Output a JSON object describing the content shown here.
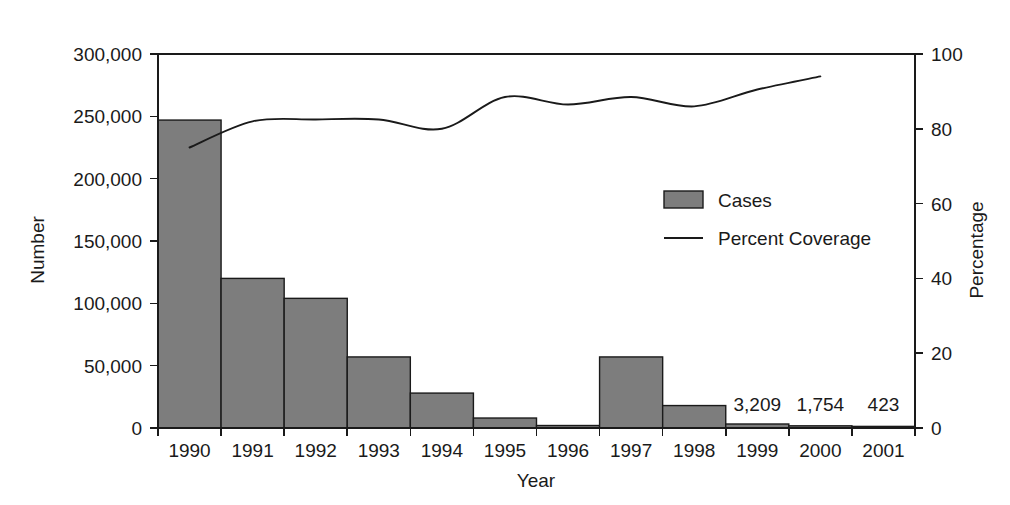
{
  "chart_data": {
    "type": "bar",
    "title": "",
    "xlabel": "Year",
    "ylabel": "Number",
    "y2label": "Percentage",
    "categories": [
      "1990",
      "1991",
      "1992",
      "1993",
      "1994",
      "1995",
      "1996",
      "1997",
      "1998",
      "1999",
      "2000",
      "2001"
    ],
    "ylim": [
      0,
      300000
    ],
    "y2lim": [
      0,
      100
    ],
    "grid": false,
    "legend_position": "center-right",
    "y_ticks": [
      "0",
      "50,000",
      "100,000",
      "150,000",
      "200,000",
      "250,000",
      "300,000"
    ],
    "y_tick_values": [
      0,
      50000,
      100000,
      150000,
      200000,
      250000,
      300000
    ],
    "y2_ticks": [
      "0",
      "20",
      "40",
      "60",
      "80",
      "100"
    ],
    "y2_tick_values": [
      0,
      20,
      40,
      60,
      80,
      100
    ],
    "series": [
      {
        "name": "Cases",
        "kind": "bar",
        "axis": "left",
        "values": [
          247000,
          120000,
          104000,
          57000,
          28000,
          8000,
          2000,
          57000,
          18000,
          3209,
          1754,
          423
        ]
      },
      {
        "name": "Percent Coverage",
        "kind": "line",
        "axis": "right",
        "x": [
          "1990",
          "1991",
          "1992",
          "1993",
          "1994",
          "1995",
          "1996",
          "1997",
          "1998",
          "1999",
          "2000"
        ],
        "values": [
          75,
          82,
          82.5,
          82.5,
          80,
          88.5,
          86.5,
          88.5,
          86,
          90.5,
          94
        ]
      }
    ],
    "annotations": [
      {
        "text": "3,209",
        "category": "1999"
      },
      {
        "text": "1,754",
        "category": "2000"
      },
      {
        "text": "423",
        "category": "2001"
      }
    ],
    "colors": {
      "bar_fill": "#7d7d7d",
      "bar_stroke": "#1a1a1a",
      "line": "#1a1a1a",
      "axis": "#1a1a1a",
      "background": "#ffffff"
    }
  },
  "legend": {
    "items": [
      {
        "label": "Cases",
        "marker": "swatch"
      },
      {
        "label": "Percent Coverage",
        "marker": "line"
      }
    ]
  },
  "axes": {
    "left_title": "Number",
    "right_title": "Percentage",
    "bottom_title": "Year"
  }
}
